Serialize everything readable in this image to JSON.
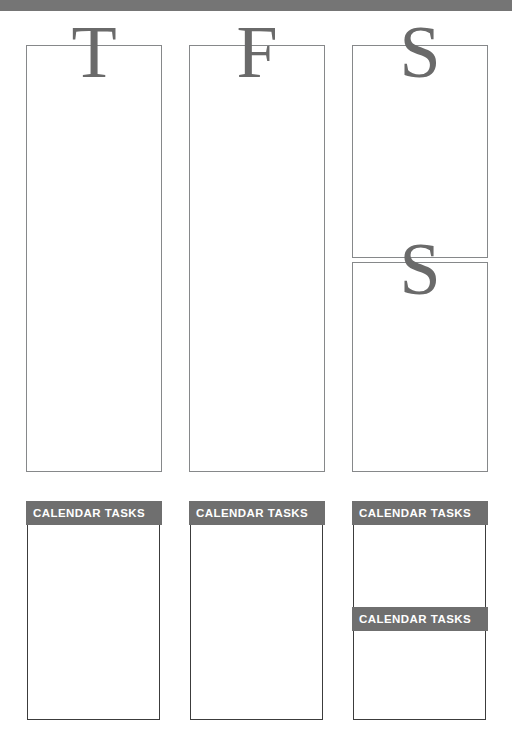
{
  "page": {
    "background_color": "#ffffff",
    "accent_gray": "#6f6f6f",
    "letter_gray": "#6a6a6a",
    "border_gray": "#86888a",
    "task_border": "#3c3c3c"
  },
  "top_bar": {
    "color": "#757575",
    "label": ""
  },
  "columns": [
    {
      "day_letters": [
        "T"
      ],
      "layout": "single",
      "tasks": [
        {
          "header": "CALENDAR TASKS",
          "body_text": ""
        }
      ]
    },
    {
      "day_letters": [
        "F"
      ],
      "layout": "single",
      "tasks": [
        {
          "header": "CALENDAR TASKS",
          "body_text": ""
        }
      ]
    },
    {
      "day_letters": [
        "S",
        "S"
      ],
      "layout": "split",
      "tasks": [
        {
          "header": "CALENDAR TASKS",
          "body_text": ""
        },
        {
          "header": "CALENDAR TASKS",
          "body_text": ""
        }
      ]
    }
  ]
}
